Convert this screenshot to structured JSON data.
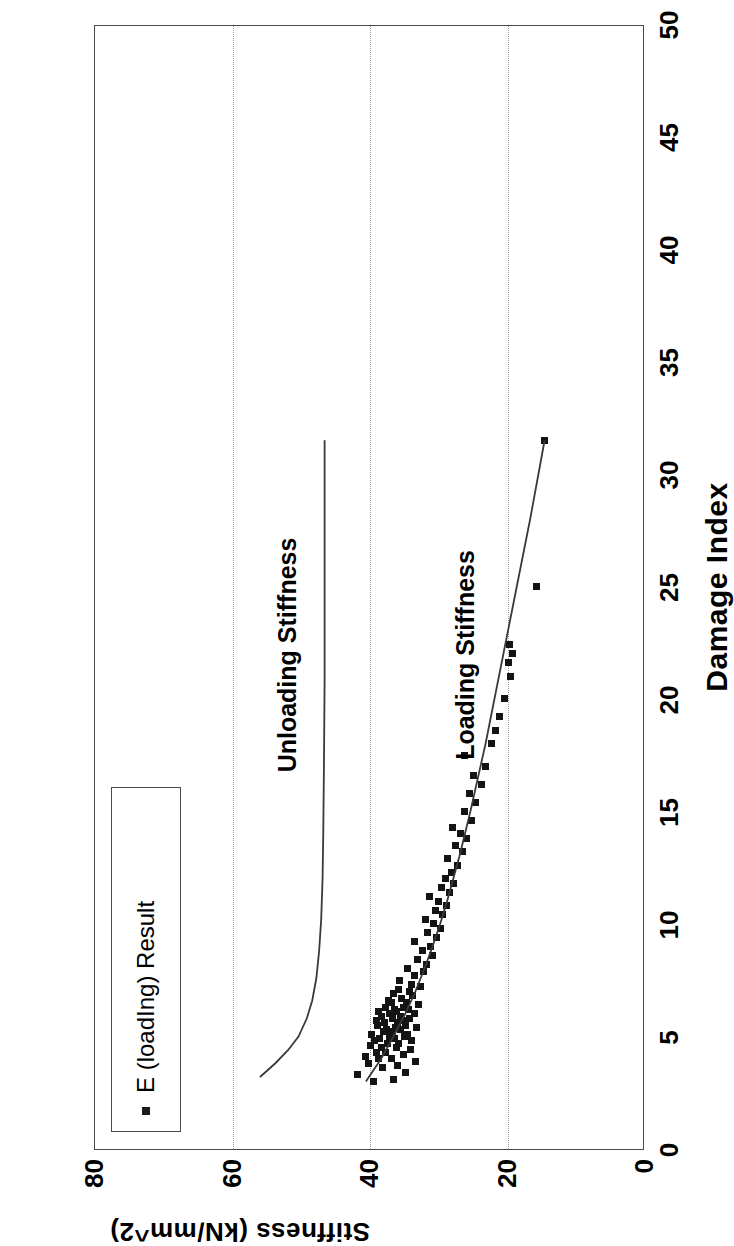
{
  "chart_data": {
    "type": "scatter",
    "title": "",
    "xlabel": "Damage Index",
    "ylabel": "Stiffness (kN/mm^2)",
    "xlim": [
      0,
      50
    ],
    "ylim": [
      0,
      80
    ],
    "xticks": [
      0,
      5,
      10,
      15,
      20,
      25,
      30,
      35,
      40,
      45,
      50
    ],
    "yticks": [
      0,
      20,
      40,
      60,
      80
    ],
    "grid": "vertical dotted gridlines at stiffness 20, 40, 60",
    "legend": {
      "position": "top-left inside plot",
      "entries": [
        {
          "label": "E (loading) Result",
          "marker": "square",
          "color": "#141414"
        }
      ]
    },
    "annotations": [
      {
        "text": "Unloading Stiffness",
        "x": 22,
        "y": 52
      },
      {
        "text": "Loading Stiffness",
        "x": 22,
        "y": 26
      }
    ],
    "series": [
      {
        "name": "E (loading) Result",
        "type": "scatter",
        "marker": "square",
        "color": "#141414",
        "points": [
          [
            3.0,
            39.5
          ],
          [
            3.1,
            36.6
          ],
          [
            3.3,
            41.8
          ],
          [
            3.4,
            34.8
          ],
          [
            3.6,
            38.2
          ],
          [
            3.7,
            36.0
          ],
          [
            3.8,
            40.2
          ],
          [
            3.9,
            33.4
          ],
          [
            4.0,
            38.8
          ],
          [
            4.0,
            36.9
          ],
          [
            4.1,
            40.6
          ],
          [
            4.2,
            35.2
          ],
          [
            4.3,
            37.8
          ],
          [
            4.3,
            39.1
          ],
          [
            4.4,
            34.1
          ],
          [
            4.5,
            38.4
          ],
          [
            4.5,
            36.2
          ],
          [
            4.6,
            40.0
          ],
          [
            4.7,
            35.8
          ],
          [
            4.7,
            37.4
          ],
          [
            4.8,
            39.3
          ],
          [
            4.8,
            33.9
          ],
          [
            4.9,
            36.5
          ],
          [
            4.9,
            38.6
          ],
          [
            5.0,
            35.0
          ],
          [
            5.0,
            37.1
          ],
          [
            5.1,
            39.8
          ],
          [
            5.1,
            34.6
          ],
          [
            5.2,
            36.8
          ],
          [
            5.2,
            38.0
          ],
          [
            5.3,
            35.5
          ],
          [
            5.3,
            37.6
          ],
          [
            5.4,
            33.2
          ],
          [
            5.4,
            36.3
          ],
          [
            5.5,
            38.9
          ],
          [
            5.5,
            34.9
          ],
          [
            5.6,
            36.0
          ],
          [
            5.6,
            37.9
          ],
          [
            5.7,
            35.3
          ],
          [
            5.7,
            39.0
          ],
          [
            5.8,
            34.2
          ],
          [
            5.8,
            36.7
          ],
          [
            5.9,
            38.3
          ],
          [
            5.9,
            35.6
          ],
          [
            6.0,
            37.2
          ],
          [
            6.0,
            33.6
          ],
          [
            6.1,
            36.1
          ],
          [
            6.1,
            38.7
          ],
          [
            6.2,
            34.4
          ],
          [
            6.2,
            36.4
          ],
          [
            6.3,
            37.7
          ],
          [
            6.3,
            35.1
          ],
          [
            6.4,
            33.0
          ],
          [
            6.5,
            36.9
          ],
          [
            6.5,
            34.7
          ],
          [
            6.6,
            37.3
          ],
          [
            6.7,
            35.4
          ],
          [
            6.8,
            33.8
          ],
          [
            6.9,
            36.6
          ],
          [
            7.0,
            34.3
          ],
          [
            7.1,
            35.9
          ],
          [
            7.2,
            32.7
          ],
          [
            7.3,
            34.0
          ],
          [
            7.5,
            35.7
          ],
          [
            7.7,
            33.5
          ],
          [
            7.9,
            32.2
          ],
          [
            8.0,
            34.5
          ],
          [
            8.2,
            31.8
          ],
          [
            8.4,
            33.1
          ],
          [
            8.6,
            30.9
          ],
          [
            8.8,
            32.4
          ],
          [
            9.0,
            31.2
          ],
          [
            9.2,
            33.6
          ],
          [
            9.4,
            30.3
          ],
          [
            9.6,
            31.7
          ],
          [
            9.8,
            29.8
          ],
          [
            10.0,
            30.8
          ],
          [
            10.2,
            32.0
          ],
          [
            10.4,
            29.4
          ],
          [
            10.6,
            30.5
          ],
          [
            10.8,
            28.9
          ],
          [
            11.0,
            30.1
          ],
          [
            11.2,
            31.3
          ],
          [
            11.4,
            28.4
          ],
          [
            11.6,
            29.6
          ],
          [
            11.8,
            27.9
          ],
          [
            12.0,
            29.0
          ],
          [
            12.3,
            28.2
          ],
          [
            12.6,
            27.3
          ],
          [
            12.9,
            28.7
          ],
          [
            13.2,
            26.6
          ],
          [
            13.5,
            27.6
          ],
          [
            13.8,
            25.9
          ],
          [
            14.0,
            26.9
          ],
          [
            14.3,
            28.0
          ],
          [
            14.6,
            25.3
          ],
          [
            15.0,
            26.2
          ],
          [
            15.4,
            24.6
          ],
          [
            15.8,
            25.6
          ],
          [
            16.2,
            23.8
          ],
          [
            16.6,
            24.9
          ],
          [
            17.0,
            23.2
          ],
          [
            17.5,
            26.3
          ],
          [
            18.0,
            22.4
          ],
          [
            18.6,
            21.8
          ],
          [
            19.2,
            21.1
          ],
          [
            20.0,
            20.4
          ],
          [
            21.0,
            19.6
          ],
          [
            21.6,
            19.9
          ],
          [
            22.0,
            19.3
          ],
          [
            22.4,
            19.7
          ],
          [
            25.0,
            15.8
          ],
          [
            31.5,
            14.6
          ]
        ]
      },
      {
        "name": "Unloading Stiffness",
        "type": "line",
        "color": "#3a3a3a",
        "points": [
          [
            3.2,
            56.0
          ],
          [
            3.8,
            53.8
          ],
          [
            4.4,
            51.9
          ],
          [
            5.0,
            50.4
          ],
          [
            5.8,
            49.2
          ],
          [
            6.6,
            48.4
          ],
          [
            7.6,
            47.8
          ],
          [
            8.8,
            47.4
          ],
          [
            10.2,
            47.1
          ],
          [
            12.0,
            46.9
          ],
          [
            14.0,
            46.8
          ],
          [
            17.0,
            46.7
          ],
          [
            21.0,
            46.6
          ],
          [
            26.0,
            46.6
          ],
          [
            31.5,
            46.6
          ]
        ]
      },
      {
        "name": "Loading Stiffness",
        "type": "line",
        "color": "#3a3a3a",
        "points": [
          [
            3.0,
            40.6
          ],
          [
            4.0,
            38.4
          ],
          [
            5.0,
            36.6
          ],
          [
            6.0,
            34.9
          ],
          [
            7.0,
            33.4
          ],
          [
            8.0,
            32.1
          ],
          [
            9.0,
            30.9
          ],
          [
            10.0,
            29.8
          ],
          [
            11.0,
            28.8
          ],
          [
            12.0,
            27.9
          ],
          [
            13.0,
            27.0
          ],
          [
            14.0,
            26.2
          ],
          [
            15.0,
            25.4
          ],
          [
            16.5,
            24.3
          ],
          [
            18.0,
            23.2
          ],
          [
            20.0,
            21.9
          ],
          [
            22.0,
            20.6
          ],
          [
            24.0,
            19.3
          ],
          [
            26.0,
            18.0
          ],
          [
            28.0,
            16.7
          ],
          [
            30.0,
            15.5
          ],
          [
            31.5,
            14.6
          ]
        ]
      }
    ]
  },
  "axes": {
    "x": {
      "title": "Damage Index",
      "ticks": [
        "0",
        "5",
        "10",
        "15",
        "20",
        "25",
        "30",
        "35",
        "40",
        "45",
        "50"
      ]
    },
    "y": {
      "title": "Stiffness (kN/mm^2)",
      "ticks": [
        "0",
        "20",
        "40",
        "60",
        "80"
      ]
    }
  },
  "legend": {
    "marker_name": "square-marker",
    "label": "E (loadIng) Result"
  },
  "annotations": {
    "unloading": "Unloading Stiffness",
    "loading": "Loading Stiffness"
  }
}
